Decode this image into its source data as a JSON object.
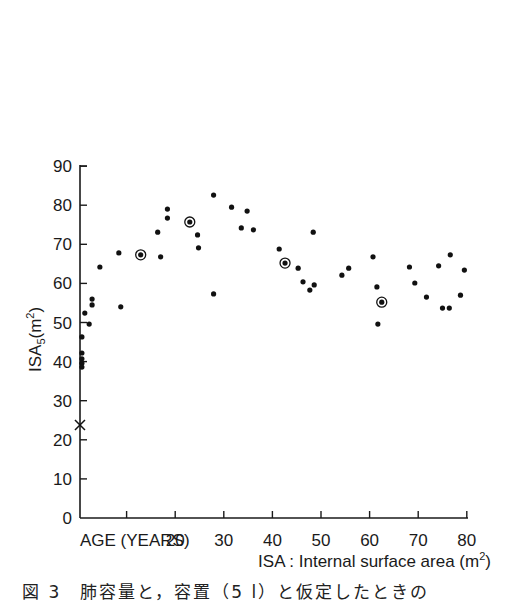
{
  "chart_data": {
    "type": "scatter",
    "title": "",
    "xlabel": "ISA : Internal surface area (m²)",
    "xlabel_parts": {
      "main": "ISA : Internal surface area (m",
      "sup": "2",
      "end": ")"
    },
    "ylabel": "ISA5 (m²)",
    "ylabel_parts": {
      "main": "ISA",
      "sub": "5",
      "open": "(m",
      "sup": "2",
      "end": ")"
    },
    "x_corner_label": "AGE (YEARS)",
    "xlim": [
      0,
      80
    ],
    "ylim": [
      0,
      90
    ],
    "grid": false,
    "legend": "none",
    "x_ticks": [
      0,
      10,
      20,
      30,
      40,
      50,
      60,
      70,
      80
    ],
    "x_tick_labels": [
      "",
      "",
      "20",
      "30",
      "40",
      "50",
      "60",
      "70",
      "80"
    ],
    "y_ticks": [
      0,
      10,
      20,
      30,
      40,
      50,
      60,
      70,
      80,
      90
    ],
    "y_tick_labels": [
      "0",
      "10",
      "20",
      "30",
      "40",
      "50",
      "60",
      "70",
      "80",
      "90"
    ],
    "series": [
      {
        "name": "individual",
        "marker": "dot",
        "points": [
          [
            0.8,
            46.3
          ],
          [
            0.8,
            42.2
          ],
          [
            0.8,
            40.7
          ],
          [
            0.8,
            39.6
          ],
          [
            0.8,
            38.6
          ],
          [
            1.4,
            52.4
          ],
          [
            2.3,
            49.6
          ],
          [
            2.9,
            56.0
          ],
          [
            2.9,
            54.5
          ],
          [
            4.5,
            64.2
          ],
          [
            8.4,
            67.8
          ],
          [
            8.8,
            54.0
          ],
          [
            16.4,
            73.1
          ],
          [
            17.0,
            66.8
          ],
          [
            18.4,
            79.0
          ],
          [
            18.4,
            76.7
          ],
          [
            24.6,
            72.4
          ],
          [
            24.8,
            69.1
          ],
          [
            27.9,
            82.6
          ],
          [
            27.9,
            57.3
          ],
          [
            31.6,
            79.5
          ],
          [
            33.6,
            74.2
          ],
          [
            34.8,
            78.5
          ],
          [
            36.1,
            73.7
          ],
          [
            41.4,
            68.8
          ],
          [
            45.3,
            63.9
          ],
          [
            46.3,
            60.4
          ],
          [
            47.7,
            58.3
          ],
          [
            48.6,
            59.6
          ],
          [
            48.4,
            73.1
          ],
          [
            54.3,
            62.1
          ],
          [
            55.7,
            63.9
          ],
          [
            60.7,
            66.8
          ],
          [
            61.5,
            59.1
          ],
          [
            61.7,
            49.6
          ],
          [
            68.2,
            64.2
          ],
          [
            69.3,
            60.1
          ],
          [
            71.7,
            56.5
          ],
          [
            74.2,
            64.5
          ],
          [
            75.0,
            53.7
          ],
          [
            76.4,
            53.7
          ],
          [
            76.6,
            67.3
          ],
          [
            78.7,
            57.0
          ],
          [
            79.5,
            63.4
          ]
        ]
      },
      {
        "name": "circled",
        "marker": "circled-dot",
        "points": [
          [
            12.9,
            67.3
          ],
          [
            23.0,
            75.7
          ],
          [
            42.6,
            65.2
          ],
          [
            62.5,
            55.2
          ]
        ]
      },
      {
        "name": "cross",
        "marker": "x",
        "points": [
          [
            0.4,
            23.8
          ]
        ]
      }
    ]
  },
  "caption": "図 3　肺容量と，容置（5 l）と仮定したときの"
}
